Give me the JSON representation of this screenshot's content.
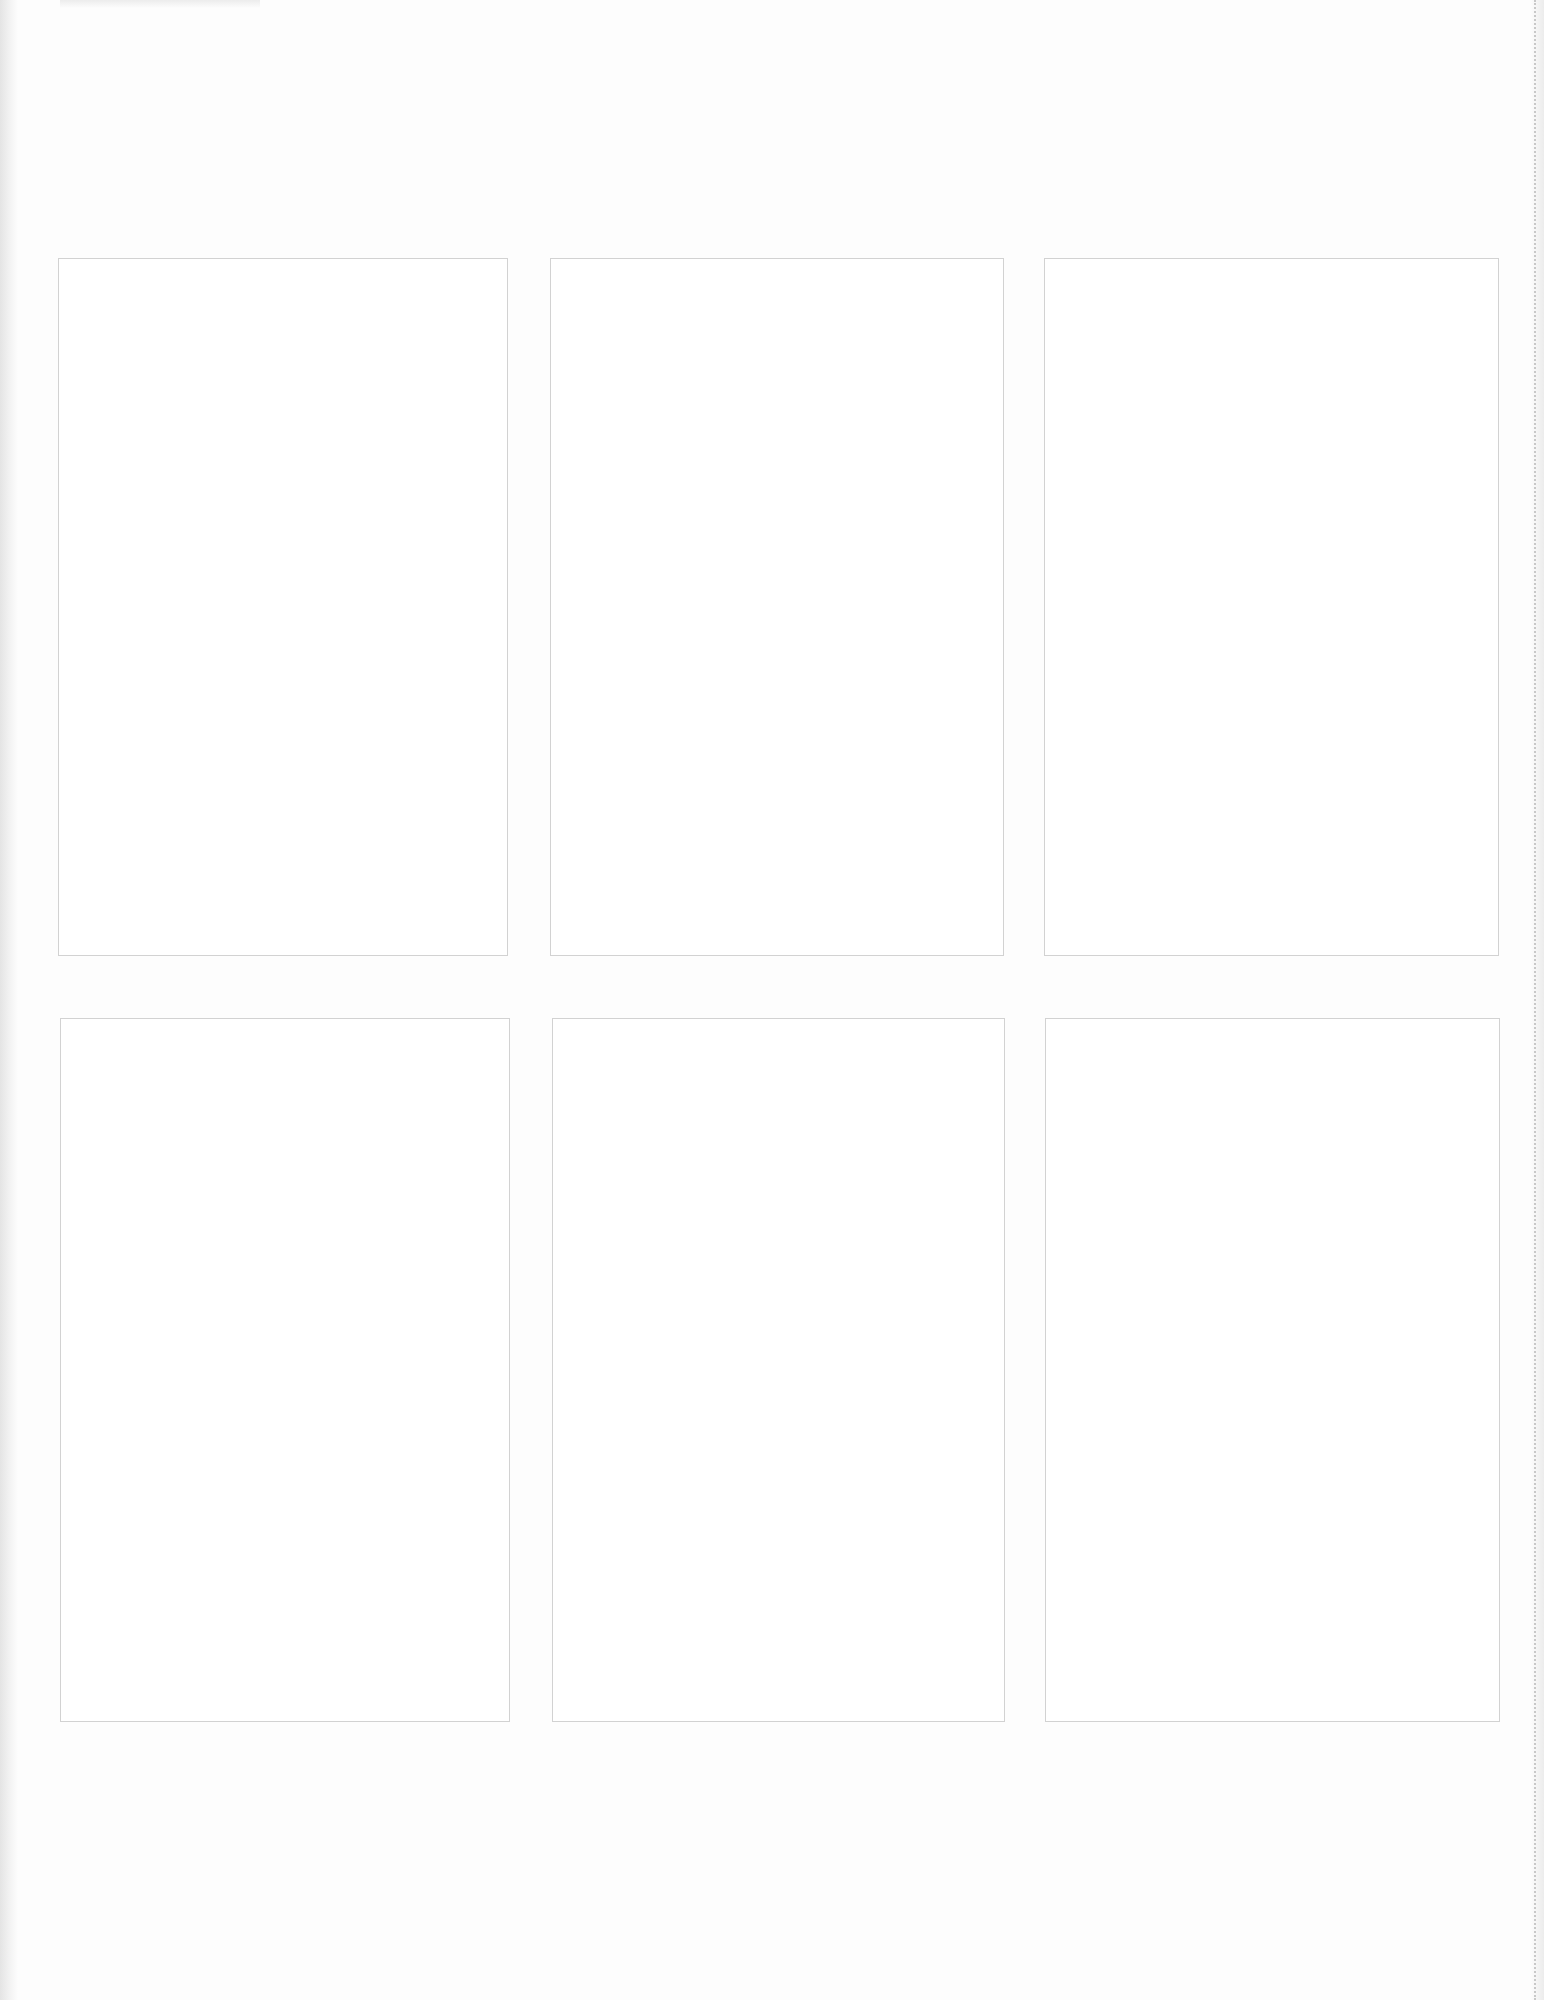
{
  "page": {
    "background": "#fdfdfd",
    "border_color": "#d2d2d2",
    "perforation_color": "#c8c8c8"
  },
  "panels": [
    {
      "row": 1,
      "col": 1,
      "x": 58,
      "y": 258,
      "w": 450,
      "h": 698
    },
    {
      "row": 1,
      "col": 2,
      "x": 550,
      "y": 258,
      "w": 454,
      "h": 698
    },
    {
      "row": 1,
      "col": 3,
      "x": 1044,
      "y": 258,
      "w": 455,
      "h": 698
    },
    {
      "row": 2,
      "col": 1,
      "x": 60,
      "y": 1018,
      "w": 450,
      "h": 704
    },
    {
      "row": 2,
      "col": 2,
      "x": 552,
      "y": 1018,
      "w": 453,
      "h": 704
    },
    {
      "row": 2,
      "col": 3,
      "x": 1045,
      "y": 1018,
      "w": 455,
      "h": 704
    }
  ]
}
